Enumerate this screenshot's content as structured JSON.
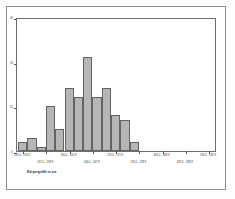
{
  "figure": {
    "caption": "Körpergröße in cm",
    "background_color": "#ffffff",
    "frame_color": "#6f6f6f",
    "outer_border_color": "#8d8d8d"
  },
  "chart_data": {
    "type": "bar",
    "title": "",
    "subtitle": "",
    "xlabel": "Körpergröße in cm",
    "ylabel": "",
    "grid": false,
    "legend": false,
    "bar_fill_color": "#b6b6b6",
    "bar_edge_color": "#636363",
    "ylim": [
      0,
      30
    ],
    "yticks": [
      0,
      10,
      20,
      30
    ],
    "ytick_labels": [
      "0",
      "10",
      "20",
      "30"
    ],
    "categories": [
      "152.0 - 154.9",
      "155.0 - 157.9",
      "158.0 - 160.9",
      "161.0 - 163.9",
      "164.0 - 166.9",
      "167.0 - 169.9",
      "170.0 - 172.9",
      "173.0 - 175.9",
      "176.0 - 178.9",
      "179.0 - 181.9",
      "182.0 - 184.9",
      "185.0 - 187.9",
      "188.0 - 190.9",
      "191.0 - 193.9"
    ],
    "values": [
      2,
      3,
      1,
      10,
      5,
      14,
      12,
      21,
      12,
      14,
      8,
      7,
      2,
      0
    ],
    "xtick_labels": [
      "152.0 - 154.9",
      "157.0 - 159.9",
      "160.0 - 162.9",
      "164.0 - 167.9",
      "170.0 - 172.9",
      "176.0 - 178.9",
      "181.0 - 183.9",
      "187.0 - 189.9",
      "190.0 - 192.9"
    ]
  }
}
